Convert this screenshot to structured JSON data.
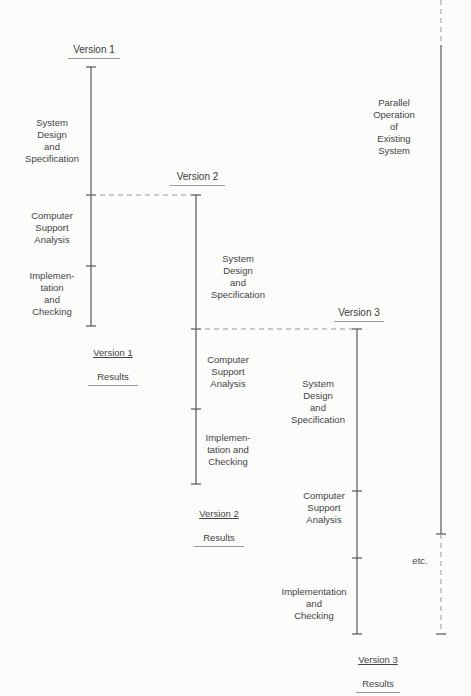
{
  "diagram": {
    "versions": [
      {
        "title": "Version 1",
        "phases": [
          "System\nDesign\nand\nSpecification",
          "Computer\nSupport\nAnalysis",
          "Implemen-\ntation\nand\nChecking"
        ],
        "results_line1": "Version 1",
        "results_line2": "Results"
      },
      {
        "title": "Version 2",
        "phases": [
          "System\nDesign\nand\nSpecification",
          "Computer\nSupport\nAnalysis",
          "Implemen-\ntation and\nChecking"
        ],
        "results_line1": "Version 2",
        "results_line2": "Results"
      },
      {
        "title": "Version 3",
        "phases": [
          "System\nDesign\nand\nSpecification",
          "Computer\nSupport\nAnalysis",
          "Implementation\nand\nChecking"
        ],
        "results_line1": "Version 3",
        "results_line2": "Results"
      }
    ],
    "parallel_label": "Parallel\nOperation\nof\nExisting\nSystem",
    "etc_label": "etc.",
    "colors": {
      "line": "#555555",
      "dashed": "#9a9a9a",
      "text": "#444444"
    }
  }
}
